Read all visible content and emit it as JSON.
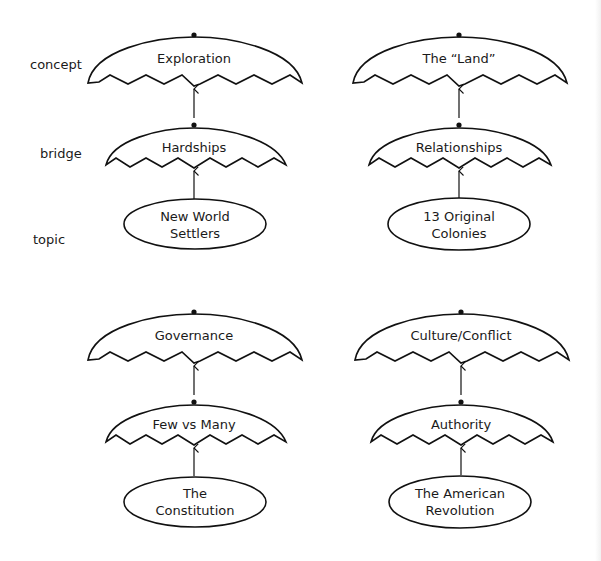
{
  "diagram": {
    "type": "concept-hierarchy",
    "level_labels": [
      {
        "id": "concept",
        "text": "concept"
      },
      {
        "id": "bridge",
        "text": "bridge"
      },
      {
        "id": "topic",
        "text": "topic"
      }
    ],
    "units": [
      {
        "concept": "Exploration",
        "bridge": "Hardships",
        "topic_lines": [
          "New World",
          "Settlers"
        ]
      },
      {
        "concept": "The “Land”",
        "bridge": "Relationships",
        "topic_lines": [
          "13 Original",
          "Colonies"
        ]
      },
      {
        "concept": "Governance",
        "bridge": "Few vs Many",
        "topic_lines": [
          "The",
          "Constitution"
        ]
      },
      {
        "concept": "Culture/Conflict",
        "bridge": "Authority",
        "topic_lines": [
          "The American",
          "Revolution"
        ]
      }
    ],
    "edges": [
      {
        "from": "topic",
        "to": "bridge",
        "style": "open-arrow"
      },
      {
        "from": "bridge",
        "to": "concept",
        "style": "open-arrow"
      }
    ],
    "colors": {
      "stroke": "#111111",
      "background": "#ffffff",
      "text": "#1a1a1a"
    }
  }
}
